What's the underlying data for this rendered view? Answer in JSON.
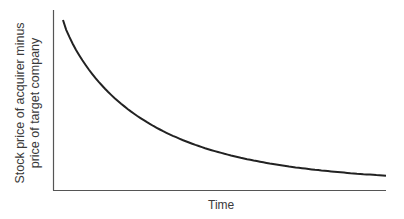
{
  "chart_data": {
    "type": "line",
    "title": "",
    "xlabel": "Time",
    "ylabel": "Stock price of acquirer minus price of target company",
    "ylabel_lines": [
      "Stock price of acquirer minus",
      "price of target company"
    ],
    "x_ticks": [],
    "y_ticks": [],
    "grid": false,
    "legend": null,
    "series": [
      {
        "name": "spread",
        "color": "#222222",
        "description": "Convex decaying curve: starts high near the y-axis, drops steeply, then flattens approaching a low value over time",
        "x": [
          0,
          0.05,
          0.1,
          0.2,
          0.3,
          0.4,
          0.5,
          0.6,
          0.7,
          0.8,
          0.9,
          1.0
        ],
        "y": [
          1.0,
          0.82,
          0.72,
          0.57,
          0.45,
          0.35,
          0.26,
          0.19,
          0.13,
          0.09,
          0.06,
          0.05
        ]
      }
    ],
    "xlim": [
      0,
      1
    ],
    "ylim": [
      0,
      1.06
    ]
  }
}
